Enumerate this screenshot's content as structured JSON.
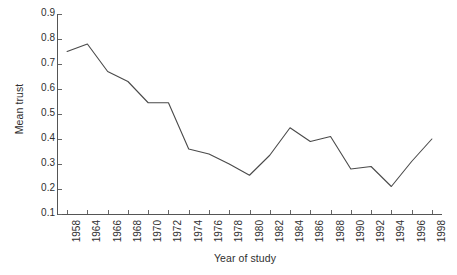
{
  "chart_data": {
    "type": "line",
    "title": "",
    "xlabel": "Year of study",
    "ylabel": "Mean trust",
    "grid": false,
    "legend": false,
    "ylim": [
      0.1,
      0.9
    ],
    "yticks": [
      0.9,
      0.8,
      0.7,
      0.6,
      0.5,
      0.4,
      0.3,
      0.2,
      0.1
    ],
    "ytick_labels": [
      "0.9",
      "0.8",
      "0.7",
      "0.6",
      "0.5",
      "0.4",
      "0.3",
      "0.2",
      "0.1"
    ],
    "categories": [
      "1958",
      "1964",
      "1966",
      "1968",
      "1970",
      "1972",
      "1974",
      "1976",
      "1978",
      "1980",
      "1982",
      "1984",
      "1986",
      "1988",
      "1990",
      "1992",
      "1994",
      "1996",
      "1998"
    ],
    "x": [
      1958,
      1964,
      1966,
      1968,
      1970,
      1972,
      1974,
      1976,
      1978,
      1980,
      1982,
      1984,
      1986,
      1988,
      1990,
      1992,
      1994,
      1996,
      1998
    ],
    "values": [
      0.75,
      0.78,
      0.67,
      0.63,
      0.545,
      0.545,
      0.36,
      0.34,
      0.3,
      0.255,
      0.335,
      0.445,
      0.39,
      0.41,
      0.28,
      0.29,
      0.21,
      0.31,
      0.4
    ],
    "series": [
      {
        "name": "Mean trust",
        "color": "#4a4a4a",
        "values": [
          0.75,
          0.78,
          0.67,
          0.63,
          0.545,
          0.545,
          0.36,
          0.34,
          0.3,
          0.255,
          0.335,
          0.445,
          0.39,
          0.41,
          0.28,
          0.29,
          0.21,
          0.31,
          0.4
        ]
      }
    ],
    "annotations": []
  },
  "axis": {
    "y_title": "Mean trust",
    "x_title": "Year of study"
  }
}
